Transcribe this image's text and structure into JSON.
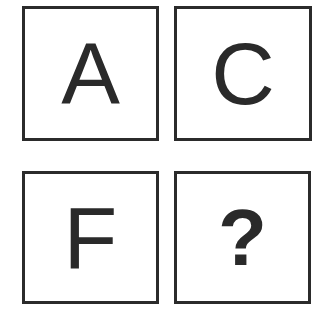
{
  "puzzle": {
    "tiles": [
      {
        "position": "top-left",
        "label": "A"
      },
      {
        "position": "top-right",
        "label": "C"
      },
      {
        "position": "bottom-left",
        "label": "F"
      },
      {
        "position": "bottom-right",
        "label": "?"
      }
    ]
  },
  "colors": {
    "border": "#2b2b2b",
    "glyph": "#2a2a2a",
    "background": "#ffffff"
  }
}
